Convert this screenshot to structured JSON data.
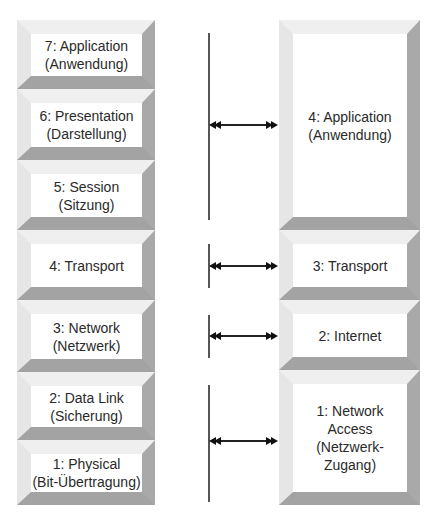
{
  "osi": {
    "layers": [
      {
        "number": "7",
        "label": "7: Application",
        "sub": "(Anwendung)",
        "top": 20,
        "bottom": 89
      },
      {
        "number": "6",
        "label": "6: Presentation",
        "sub": "(Darstellung)",
        "top": 89,
        "bottom": 160
      },
      {
        "number": "5",
        "label": "5: Session",
        "sub": "(Sitzung)",
        "top": 160,
        "bottom": 230
      },
      {
        "number": "4",
        "label": "4: Transport",
        "sub": "",
        "top": 230,
        "bottom": 300
      },
      {
        "number": "3",
        "label": "3: Network",
        "sub": "(Netzwerk)",
        "top": 300,
        "bottom": 372
      },
      {
        "number": "2",
        "label": "2: Data Link",
        "sub": "(Sicherung)",
        "top": 372,
        "bottom": 440
      },
      {
        "number": "1",
        "label": "1: Physical",
        "sub": "(Bit-Übertragung)",
        "top": 440,
        "bottom": 505
      }
    ]
  },
  "tcpip": {
    "layers": [
      {
        "number": "4",
        "label": "4: Application",
        "sub": "(Anwendung)",
        "top": 20,
        "bottom": 230
      },
      {
        "number": "3",
        "label": "3: Transport",
        "sub": "",
        "top": 230,
        "bottom": 300
      },
      {
        "number": "2",
        "label": "2: Internet",
        "sub": "",
        "top": 300,
        "bottom": 370
      },
      {
        "number": "1",
        "label": "1: Network Access",
        "sub": "(Netzwerk-",
        "sub2": "Zugang)",
        "top": 370,
        "bottom": 505
      }
    ]
  },
  "connectors": [
    {
      "line_top": 33,
      "line_bottom": 220,
      "arrow_y": 125
    },
    {
      "line_top": 244,
      "line_bottom": 288,
      "arrow_y": 266
    },
    {
      "line_top": 315,
      "line_bottom": 358,
      "arrow_y": 336
    },
    {
      "line_top": 385,
      "line_bottom": 502,
      "arrow_y": 441
    }
  ],
  "colors": {
    "bevel_light": "#efefef",
    "bevel_dark": "#a9a9a9",
    "line": "#555555",
    "arrow": "#111111"
  }
}
